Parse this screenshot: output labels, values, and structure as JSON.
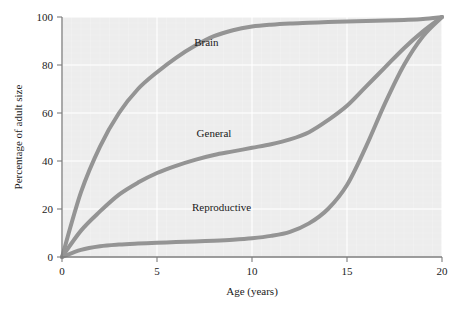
{
  "chart_data": {
    "type": "line",
    "title": "",
    "xlabel": "Age (years)",
    "ylabel": "Percentage of adult size",
    "xlim": [
      0,
      20
    ],
    "ylim": [
      0,
      100
    ],
    "xticks": [
      0,
      5,
      10,
      15,
      20
    ],
    "yticks": [
      0,
      20,
      40,
      60,
      80,
      100
    ],
    "grid": true,
    "legend_position": "inline-annotations",
    "x": [
      0,
      1,
      2,
      3,
      4,
      5,
      6,
      7,
      8,
      9,
      10,
      11,
      12,
      13,
      14,
      15,
      16,
      17,
      18,
      19,
      20
    ],
    "series": [
      {
        "name": "Brain",
        "label": "Brain",
        "color": "#949494",
        "values": [
          0,
          27,
          46,
          60,
          70,
          77,
          83,
          88,
          92,
          94.5,
          96,
          96.8,
          97.3,
          97.6,
          97.9,
          98.1,
          98.3,
          98.5,
          98.8,
          99.2,
          100
        ]
      },
      {
        "name": "General",
        "label": "General",
        "color": "#949494",
        "values": [
          0,
          11,
          19,
          26,
          31,
          35,
          38,
          40.5,
          42.5,
          44,
          45.5,
          47,
          49,
          52,
          57,
          63,
          71,
          79,
          87,
          94,
          100
        ]
      },
      {
        "name": "Reproductive",
        "label": "Reproductive",
        "color": "#949494",
        "values": [
          0,
          3,
          4.5,
          5.2,
          5.6,
          5.9,
          6.2,
          6.5,
          6.8,
          7.2,
          7.8,
          8.8,
          10.5,
          14,
          20,
          30,
          46,
          64,
          80,
          92,
          100
        ]
      }
    ],
    "annotations": [
      {
        "text": "Brain",
        "x": 7.6,
        "y": 88
      },
      {
        "text": "General",
        "x": 8.0,
        "y": 50
      },
      {
        "text": "Reproductive",
        "x": 8.4,
        "y": 19
      }
    ]
  },
  "axes": {
    "x": {
      "title": "Age (years)",
      "tick_labels": [
        "0",
        "5",
        "10",
        "15",
        "20"
      ]
    },
    "y": {
      "title": "Percentage of adult size",
      "tick_labels": [
        "0",
        "20",
        "40",
        "60",
        "80",
        "100"
      ]
    }
  },
  "style": {
    "plot_background": "#ededed",
    "gridline_color": "#fafafa",
    "axis_color": "#7d7d7d",
    "curve_color": "#949494",
    "curve_width": 4,
    "text_color": "#1a1a1a",
    "page_background": "#ffffff"
  }
}
